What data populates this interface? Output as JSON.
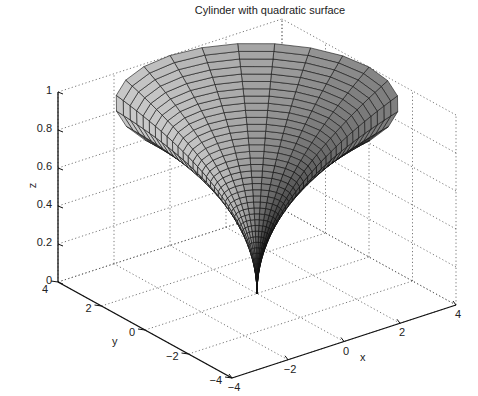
{
  "chart_data": {
    "type": "surface3d",
    "title": "Cylinder with quadratic surface",
    "xlabel": "x",
    "ylabel": "y",
    "zlabel": "z",
    "xlim": [
      -4,
      4
    ],
    "ylim": [
      -4,
      4
    ],
    "zlim": [
      0,
      1
    ],
    "xticks": [
      "-4",
      "-2",
      "0",
      "2",
      "4"
    ],
    "yticks": [
      "-4",
      "-2",
      "0",
      "2",
      "4"
    ],
    "zticks": [
      "0",
      "0.2",
      "0.4",
      "0.6",
      "0.8",
      "1"
    ],
    "grid": true,
    "colormap": "gray",
    "surface": "cylinder with radius profile r = 4*z^2 (quadratic), funnel shape from point at z=0 to radius 4 at z=1",
    "mesh_lines": "black edges"
  },
  "labels": {
    "title": "Cylinder with quadratic surface",
    "x": "x",
    "y": "y",
    "z": "z",
    "z_ticks": [
      "1",
      "0.8",
      "0.6",
      "0.4",
      "0.2",
      "0"
    ],
    "y_ticks": [
      "4",
      "2",
      "0",
      "−2",
      "−4"
    ],
    "x_ticks": [
      "−4",
      "−2",
      "0",
      "2",
      "4"
    ]
  }
}
